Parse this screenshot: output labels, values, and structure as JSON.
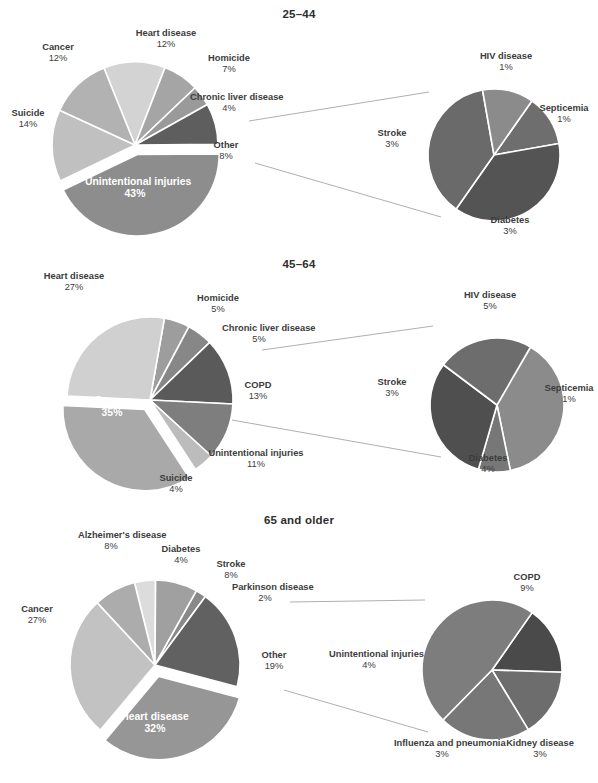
{
  "figure": {
    "background": "#ffffff",
    "text_color": "#3c3c3c",
    "inside_label_color": "#ffffff",
    "leader_line_color": "#9a9a9a"
  },
  "panels": [
    {
      "id": "25-44",
      "title": "25–44",
      "main_pie": {
        "name": "main-pie-25-44",
        "cx": 135,
        "cy": 145,
        "r": 83,
        "slices": [
          {
            "label": "Unintentional injuries",
            "pct": 43,
            "value": "43%",
            "color": "#8d8d8d",
            "exploded": true,
            "inside": true
          },
          {
            "label": "Suicide",
            "pct": 14,
            "value": "14%",
            "color": "#c0c0c0",
            "exploded": false,
            "inside": false
          },
          {
            "label": "Cancer",
            "pct": 12,
            "value": "12%",
            "color": "#b2b2b2",
            "exploded": false,
            "inside": false
          },
          {
            "label": "Heart disease",
            "pct": 12,
            "value": "12%",
            "color": "#d3d3d3",
            "exploded": false,
            "inside": false
          },
          {
            "label": "Homicide",
            "pct": 7,
            "value": "7%",
            "color": "#a5a5a5",
            "exploded": false,
            "inside": false
          },
          {
            "label": "Chronic liver disease",
            "pct": 4,
            "value": "4%",
            "color": "#9a9a9a",
            "exploded": false,
            "inside": false
          },
          {
            "label": "Other",
            "pct": 8,
            "value": "8%",
            "color": "#5e5e5e",
            "exploded": false,
            "inside": false
          }
        ]
      },
      "detail_pie": {
        "name": "detail-pie-25-44",
        "cx": 494,
        "cy": 155,
        "r": 66,
        "of_slice": "Other",
        "slices": [
          {
            "label": "HIV disease",
            "pct": 1,
            "value": "1%",
            "color": "#8b8b8b"
          },
          {
            "label": "Septicemia",
            "pct": 1,
            "value": "1%",
            "color": "#6e6e6e"
          },
          {
            "label": "Diabetes",
            "pct": 3,
            "value": "3%",
            "color": "#545454"
          },
          {
            "label": "Stroke",
            "pct": 3,
            "value": "3%",
            "color": "#6a6a6a"
          }
        ]
      },
      "labels": [
        {
          "name": "label-heart-disease",
          "text": "Heart disease",
          "pct": "12%",
          "x": 121,
          "y": 28,
          "w": 90,
          "inside": false
        },
        {
          "name": "label-cancer",
          "text": "Cancer",
          "pct": "12%",
          "x": 27,
          "y": 42,
          "w": 62,
          "inside": false
        },
        {
          "name": "label-suicide",
          "text": "Suicide",
          "pct": "14%",
          "x": 1,
          "y": 108,
          "w": 54,
          "inside": false
        },
        {
          "name": "label-homicide",
          "text": "Homicide",
          "pct": "7%",
          "x": 198,
          "y": 53,
          "w": 62,
          "inside": false
        },
        {
          "name": "label-chronic-liver-disease",
          "text": "Chronic liver disease",
          "pct": "4%",
          "x": 190,
          "y": 92,
          "w": 78,
          "inside": false
        },
        {
          "name": "label-other",
          "text": "Other",
          "pct": "8%",
          "x": 202,
          "y": 140,
          "w": 48,
          "inside": false
        },
        {
          "name": "label-unintentional-injuries",
          "text": "Unintentional injuries",
          "pct": "43%",
          "x": 85,
          "y": 176,
          "w": 100,
          "inside": true
        },
        {
          "name": "label-hiv-disease",
          "text": "HIV disease",
          "pct": "1%",
          "x": 468,
          "y": 51,
          "w": 76,
          "inside": false
        },
        {
          "name": "label-septicemia",
          "text": "Septicemia",
          "pct": "1%",
          "x": 530,
          "y": 103,
          "w": 68,
          "inside": false
        },
        {
          "name": "label-diabetes",
          "text": "Diabetes",
          "pct": "3%",
          "x": 478,
          "y": 215,
          "w": 64,
          "inside": false
        },
        {
          "name": "label-stroke",
          "text": "Stroke",
          "pct": "3%",
          "x": 366,
          "y": 128,
          "w": 52,
          "inside": false
        }
      ]
    },
    {
      "id": "45-64",
      "title": "45–64",
      "main_pie": {
        "name": "main-pie-45-64",
        "cx": 150,
        "cy": 145,
        "r": 83,
        "slices": [
          {
            "label": "Cancer",
            "pct": 35,
            "value": "35%",
            "color": "#a9a9a9",
            "exploded": true,
            "inside": true
          },
          {
            "label": "Heart disease",
            "pct": 27,
            "value": "27%",
            "color": "#d0d0d0",
            "exploded": false,
            "inside": false
          },
          {
            "label": "Homicide",
            "pct": 5,
            "value": "5%",
            "color": "#9d9d9d",
            "exploded": false,
            "inside": false
          },
          {
            "label": "Chronic liver disease",
            "pct": 5,
            "value": "5%",
            "color": "#878787",
            "exploded": false,
            "inside": false
          },
          {
            "label": "COPD",
            "pct": 13,
            "value": "13%",
            "color": "#5a5a5a",
            "exploded": false,
            "inside": false
          },
          {
            "label": "Unintentional injuries",
            "pct": 11,
            "value": "11%",
            "color": "#7e7e7e",
            "exploded": false,
            "inside": false
          },
          {
            "label": "Suicide",
            "pct": 4,
            "value": "4%",
            "color": "#bcbcbc",
            "exploded": false,
            "inside": false
          }
        ]
      },
      "detail_pie": {
        "name": "detail-pie-45-64",
        "cx": 497,
        "cy": 150,
        "r": 67,
        "of_slice": "Chronic liver disease",
        "slices": [
          {
            "label": "HIV disease",
            "pct": 5,
            "value": "5%",
            "color": "#8b8b8b"
          },
          {
            "label": "Septicemia",
            "pct": 1,
            "value": "1%",
            "color": "#777777"
          },
          {
            "label": "Diabetes",
            "pct": 4,
            "value": "4%",
            "color": "#4f4f4f"
          },
          {
            "label": "Stroke",
            "pct": 3,
            "value": "3%",
            "color": "#6d6d6d"
          }
        ]
      },
      "labels": [
        {
          "name": "label-heart-disease",
          "text": "Heart disease",
          "pct": "27%",
          "x": 28,
          "y": 16,
          "w": 92,
          "inside": false
        },
        {
          "name": "label-homicide",
          "text": "Homicide",
          "pct": "5%",
          "x": 186,
          "y": 38,
          "w": 64,
          "inside": false
        },
        {
          "name": "label-chronic-liver-disease",
          "text": "Chronic liver disease",
          "pct": "5%",
          "x": 222,
          "y": 68,
          "w": 74,
          "inside": false
        },
        {
          "name": "label-copd",
          "text": "COPD",
          "pct": "13%",
          "x": 232,
          "y": 125,
          "w": 52,
          "inside": false
        },
        {
          "name": "label-unintentional-injuries",
          "text": "Unintentional injuries",
          "pct": "11%",
          "x": 196,
          "y": 193,
          "w": 120,
          "inside": false
        },
        {
          "name": "label-suicide",
          "text": "Suicide",
          "pct": "4%",
          "x": 148,
          "y": 218,
          "w": 56,
          "inside": false
        },
        {
          "name": "label-cancer",
          "text": "Cancer",
          "pct": "35%",
          "x": 72,
          "y": 140,
          "w": 80,
          "inside": true
        },
        {
          "name": "label-hiv-disease",
          "text": "HIV disease",
          "pct": "5%",
          "x": 450,
          "y": 35,
          "w": 80,
          "inside": false
        },
        {
          "name": "label-septicemia",
          "text": "Septicemia",
          "pct": "1%",
          "x": 538,
          "y": 128,
          "w": 62,
          "inside": false
        },
        {
          "name": "label-diabetes",
          "text": "Diabetes",
          "pct": "4%",
          "x": 455,
          "y": 198,
          "w": 66,
          "inside": false
        },
        {
          "name": "label-stroke",
          "text": "Stroke",
          "pct": "3%",
          "x": 366,
          "y": 122,
          "w": 52,
          "inside": false
        }
      ]
    },
    {
      "id": "65-and-older",
      "title": "65 and older",
      "main_pie": {
        "name": "main-pie-65",
        "cx": 155,
        "cy": 155,
        "r": 85,
        "slices": [
          {
            "label": "Heart disease",
            "pct": 32,
            "value": "32%",
            "color": "#969696",
            "exploded": true,
            "inside": true
          },
          {
            "label": "Cancer",
            "pct": 27,
            "value": "27%",
            "color": "#c2c2c2",
            "exploded": false,
            "inside": false
          },
          {
            "label": "Alzheimer's disease",
            "pct": 8,
            "value": "8%",
            "color": "#acacac",
            "exploded": false,
            "inside": false
          },
          {
            "label": "Diabetes",
            "pct": 4,
            "value": "4%",
            "color": "#dcdcdc",
            "exploded": false,
            "inside": false
          },
          {
            "label": "Stroke",
            "pct": 8,
            "value": "8%",
            "color": "#a0a0a0",
            "exploded": false,
            "inside": false
          },
          {
            "label": "Parkinson disease",
            "pct": 2,
            "value": "2%",
            "color": "#898989",
            "exploded": false,
            "inside": false
          },
          {
            "label": "Other",
            "pct": 19,
            "value": "19%",
            "color": "#616161",
            "exploded": false,
            "inside": false
          }
        ]
      },
      "detail_pie": {
        "name": "detail-pie-65",
        "cx": 492,
        "cy": 160,
        "r": 70,
        "of_slice": "Other",
        "slices": [
          {
            "label": "COPD",
            "pct": 9,
            "value": "9%",
            "color": "#7d7d7d"
          },
          {
            "label": "Kidney disease",
            "pct": 3,
            "value": "3%",
            "color": "#4a4a4a"
          },
          {
            "label": "Influenza and pneumonia",
            "pct": 3,
            "value": "3%",
            "color": "#6d6d6d"
          },
          {
            "label": "Unintentional injuries",
            "pct": 4,
            "value": "4%",
            "color": "#777777"
          }
        ]
      },
      "labels": [
        {
          "name": "label-alzheimers-disease",
          "text": "Alzheimer's disease",
          "pct": "8%",
          "x": 78,
          "y": 20,
          "w": 66,
          "inside": false
        },
        {
          "name": "label-diabetes-main",
          "text": "Diabetes",
          "pct": "4%",
          "x": 151,
          "y": 34,
          "w": 60,
          "inside": false
        },
        {
          "name": "label-stroke-main",
          "text": "Stroke",
          "pct": "8%",
          "x": 203,
          "y": 49,
          "w": 56,
          "inside": false
        },
        {
          "name": "label-parkinson-disease",
          "text": "Parkinson disease",
          "pct": "2%",
          "x": 232,
          "y": 72,
          "w": 66,
          "inside": false
        },
        {
          "name": "label-other",
          "text": "Other",
          "pct": "19%",
          "x": 249,
          "y": 140,
          "w": 50,
          "inside": false
        },
        {
          "name": "label-cancer",
          "text": "Cancer",
          "pct": "27%",
          "x": 8,
          "y": 94,
          "w": 58,
          "inside": false
        },
        {
          "name": "label-heart-disease",
          "text": "Heart disease",
          "pct": "32%",
          "x": 110,
          "y": 201,
          "w": 90,
          "inside": true
        },
        {
          "name": "label-copd",
          "text": "COPD",
          "pct": "9%",
          "x": 499,
          "y": 62,
          "w": 56,
          "inside": false
        },
        {
          "name": "label-unintentional-injuries",
          "text": "Unintentional injuries",
          "pct": "4%",
          "x": 329,
          "y": 139,
          "w": 80,
          "inside": false
        },
        {
          "name": "label-influenza-and-pneumonia",
          "text": "Influenza and pneumonia",
          "pct": "3%",
          "x": 394,
          "y": 228,
          "w": 96,
          "inside": false
        },
        {
          "name": "label-kidney-disease",
          "text": "Kidney disease",
          "pct": "3%",
          "x": 492,
          "y": 228,
          "w": 96,
          "inside": false
        }
      ]
    }
  ]
}
